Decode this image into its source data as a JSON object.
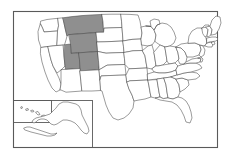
{
  "map": {
    "title": "United States map with highlighted states",
    "region_name": "Mountain West",
    "projection": "albers-usa",
    "background_color": "#ffffff",
    "frame_color": "#5a5a5a",
    "state_fill_color": "#ffffff",
    "state_border_color": "#4a4a4a",
    "highlight_color": "#8f8f8f",
    "highlight_count": "4",
    "total_states": "50",
    "labels_visible": "false",
    "legend_visible": "false",
    "highlighted_states": [
      {
        "code": "MT",
        "name": "Montana"
      },
      {
        "code": "WY",
        "name": "Wyoming"
      },
      {
        "code": "UT",
        "name": "Utah"
      },
      {
        "code": "CO",
        "name": "Colorado"
      }
    ],
    "insets": [
      {
        "id": "hawaii",
        "name": "Hawaii",
        "code": "HI",
        "highlighted": "false"
      },
      {
        "id": "alaska",
        "name": "Alaska",
        "code": "AK",
        "highlighted": "false"
      }
    ],
    "states": [
      {
        "code": "WA",
        "name": "Washington",
        "highlighted": "false"
      },
      {
        "code": "OR",
        "name": "Oregon",
        "highlighted": "false"
      },
      {
        "code": "CA",
        "name": "California",
        "highlighted": "false"
      },
      {
        "code": "NV",
        "name": "Nevada",
        "highlighted": "false"
      },
      {
        "code": "ID",
        "name": "Idaho",
        "highlighted": "false"
      },
      {
        "code": "MT",
        "name": "Montana",
        "highlighted": "true"
      },
      {
        "code": "WY",
        "name": "Wyoming",
        "highlighted": "true"
      },
      {
        "code": "UT",
        "name": "Utah",
        "highlighted": "true"
      },
      {
        "code": "CO",
        "name": "Colorado",
        "highlighted": "true"
      },
      {
        "code": "AZ",
        "name": "Arizona",
        "highlighted": "false"
      },
      {
        "code": "NM",
        "name": "New Mexico",
        "highlighted": "false"
      },
      {
        "code": "ND",
        "name": "North Dakota",
        "highlighted": "false"
      },
      {
        "code": "SD",
        "name": "South Dakota",
        "highlighted": "false"
      },
      {
        "code": "NE",
        "name": "Nebraska",
        "highlighted": "false"
      },
      {
        "code": "KS",
        "name": "Kansas",
        "highlighted": "false"
      },
      {
        "code": "OK",
        "name": "Oklahoma",
        "highlighted": "false"
      },
      {
        "code": "TX",
        "name": "Texas",
        "highlighted": "false"
      },
      {
        "code": "MN",
        "name": "Minnesota",
        "highlighted": "false"
      },
      {
        "code": "IA",
        "name": "Iowa",
        "highlighted": "false"
      },
      {
        "code": "MO",
        "name": "Missouri",
        "highlighted": "false"
      },
      {
        "code": "AR",
        "name": "Arkansas",
        "highlighted": "false"
      },
      {
        "code": "LA",
        "name": "Louisiana",
        "highlighted": "false"
      },
      {
        "code": "WI",
        "name": "Wisconsin",
        "highlighted": "false"
      },
      {
        "code": "IL",
        "name": "Illinois",
        "highlighted": "false"
      },
      {
        "code": "MS",
        "name": "Mississippi",
        "highlighted": "false"
      },
      {
        "code": "MI",
        "name": "Michigan",
        "highlighted": "false"
      },
      {
        "code": "IN",
        "name": "Indiana",
        "highlighted": "false"
      },
      {
        "code": "OH",
        "name": "Ohio",
        "highlighted": "false"
      },
      {
        "code": "KY",
        "name": "Kentucky",
        "highlighted": "false"
      },
      {
        "code": "TN",
        "name": "Tennessee",
        "highlighted": "false"
      },
      {
        "code": "AL",
        "name": "Alabama",
        "highlighted": "false"
      },
      {
        "code": "GA",
        "name": "Georgia",
        "highlighted": "false"
      },
      {
        "code": "FL",
        "name": "Florida",
        "highlighted": "false"
      },
      {
        "code": "SC",
        "name": "South Carolina",
        "highlighted": "false"
      },
      {
        "code": "NC",
        "name": "North Carolina",
        "highlighted": "false"
      },
      {
        "code": "VA",
        "name": "Virginia",
        "highlighted": "false"
      },
      {
        "code": "WV",
        "name": "West Virginia",
        "highlighted": "false"
      },
      {
        "code": "MD",
        "name": "Maryland",
        "highlighted": "false"
      },
      {
        "code": "DE",
        "name": "Delaware",
        "highlighted": "false"
      },
      {
        "code": "PA",
        "name": "Pennsylvania",
        "highlighted": "false"
      },
      {
        "code": "NJ",
        "name": "New Jersey",
        "highlighted": "false"
      },
      {
        "code": "NY",
        "name": "New York",
        "highlighted": "false"
      },
      {
        "code": "CT",
        "name": "Connecticut",
        "highlighted": "false"
      },
      {
        "code": "RI",
        "name": "Rhode Island",
        "highlighted": "false"
      },
      {
        "code": "MA",
        "name": "Massachusetts",
        "highlighted": "false"
      },
      {
        "code": "VT",
        "name": "Vermont",
        "highlighted": "false"
      },
      {
        "code": "NH",
        "name": "New Hampshire",
        "highlighted": "false"
      },
      {
        "code": "ME",
        "name": "Maine",
        "highlighted": "false"
      },
      {
        "code": "AK",
        "name": "Alaska",
        "highlighted": "false"
      },
      {
        "code": "HI",
        "name": "Hawaii",
        "highlighted": "false"
      }
    ]
  }
}
